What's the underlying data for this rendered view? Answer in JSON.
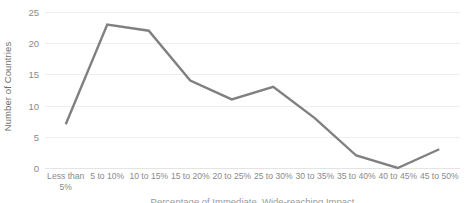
{
  "chart_data": {
    "type": "line",
    "title": "",
    "subtitle": "",
    "xlabel": "Percentage of Immediate, Wide-reaching Impact",
    "ylabel": "Number of Countries",
    "categories": [
      "Less than 5%",
      "5 to 10%",
      "10 to 15%",
      "15 to 20%",
      "20 to 25%",
      "25 to 30%",
      "30 to 35%",
      "35 to 40%",
      "40 to 45%",
      "45 to 50%"
    ],
    "values": [
      7,
      23,
      22,
      14,
      11,
      13,
      8,
      2,
      0,
      3
    ],
    "series": [
      {
        "name": "Number of Countries",
        "values": [
          7,
          23,
          22,
          14,
          11,
          13,
          8,
          2,
          0,
          3
        ],
        "color": "#808080"
      }
    ],
    "ylim": [
      0,
      25
    ],
    "yticks": [
      0,
      5,
      10,
      15,
      20,
      25
    ],
    "ytick_labels": [
      "0",
      "5",
      "10",
      "15",
      "20",
      "25"
    ],
    "grid": true,
    "grid_axis": "y",
    "legend": false,
    "legend_position": "none",
    "line_color": "#808080",
    "line_width": 2.4,
    "markers": false,
    "gridline_color": "#eeeeee",
    "background_color": "#ffffff",
    "text_color": "#8a8a8a"
  },
  "axes": {
    "y_title": "Number of Countries",
    "x_title": "Percentage of Immediate, Wide-reaching Impact",
    "y_ticks": [
      {
        "label": "25",
        "value": 25
      },
      {
        "label": "20",
        "value": 20
      },
      {
        "label": "15",
        "value": 15
      },
      {
        "label": "10",
        "value": 10
      },
      {
        "label": "5",
        "value": 5
      },
      {
        "label": "0",
        "value": 0
      }
    ],
    "x_ticks": [
      {
        "label": "Less than 5%",
        "line1": "Less than",
        "line2": "5%"
      },
      {
        "label": "5 to 10%",
        "line1": "5 to 10%",
        "line2": ""
      },
      {
        "label": "10 to 15%",
        "line1": "10 to 15%",
        "line2": ""
      },
      {
        "label": "15 to 20%",
        "line1": "15 to 20%",
        "line2": ""
      },
      {
        "label": "20 to 25%",
        "line1": "20 to 25%",
        "line2": ""
      },
      {
        "label": "25 to 30%",
        "line1": "25 to 30%",
        "line2": ""
      },
      {
        "label": "30 to 35%",
        "line1": "30 to 35%",
        "line2": ""
      },
      {
        "label": "35 to 40%",
        "line1": "35 to 40%",
        "line2": ""
      },
      {
        "label": "40 to 45%",
        "line1": "40 to 45%",
        "line2": ""
      },
      {
        "label": "45 to 50%",
        "line1": "45 to 50%",
        "line2": ""
      }
    ]
  }
}
